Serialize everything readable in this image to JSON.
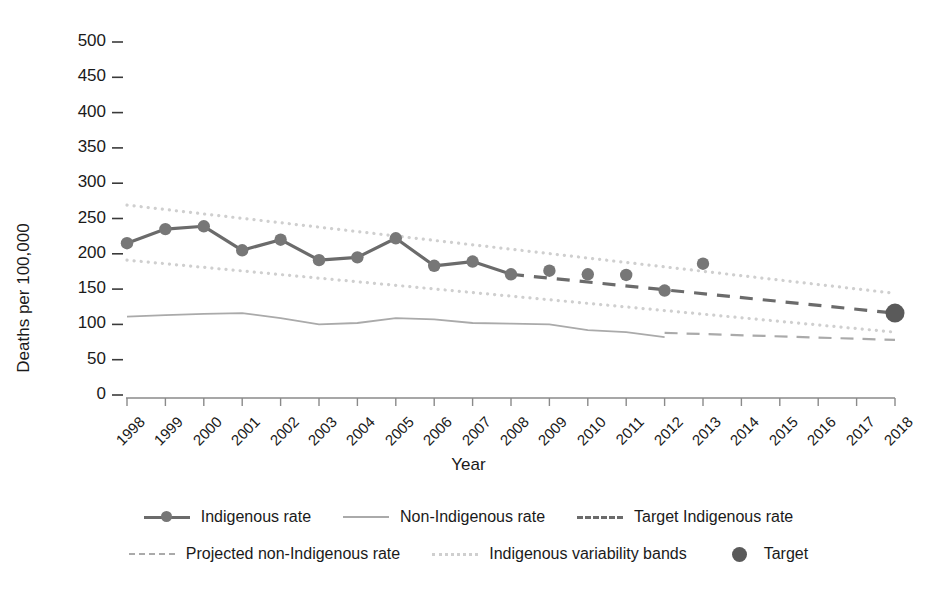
{
  "chart_data": {
    "type": "line",
    "title": "",
    "xlabel": "Year",
    "ylabel": "Deaths per 100,000",
    "xlim": [
      1998,
      2018
    ],
    "ylim": [
      0,
      500
    ],
    "ytick_labels": [
      "0",
      "50",
      "100",
      "150",
      "200",
      "250",
      "300",
      "350",
      "400",
      "450",
      "500"
    ],
    "ytick_values": [
      0,
      50,
      100,
      150,
      200,
      250,
      300,
      350,
      400,
      450,
      500
    ],
    "xtick_labels": [
      "1998",
      "1999",
      "2000",
      "2001",
      "2002",
      "2003",
      "2004",
      "2005",
      "2006",
      "2007",
      "2008",
      "2009",
      "2010",
      "2011",
      "2012",
      "2013",
      "2014",
      "2015",
      "2016",
      "2017",
      "2018"
    ],
    "grid": false,
    "legend_position": "bottom",
    "series": [
      {
        "name": "Indigenous rate",
        "style": "solid-with-markers",
        "color": "#6b6b6b",
        "x": [
          1998,
          1999,
          2000,
          2001,
          2002,
          2003,
          2004,
          2005,
          2006,
          2007,
          2008
        ],
        "values": [
          215,
          235,
          239,
          205,
          220,
          191,
          195,
          222,
          183,
          189,
          171
        ]
      },
      {
        "name": "Non-Indigenous rate",
        "style": "solid",
        "color": "#aaaaaa",
        "x": [
          1998,
          1999,
          2000,
          2001,
          2002,
          2003,
          2004,
          2005,
          2006,
          2007,
          2008,
          2009,
          2010,
          2011,
          2012
        ],
        "values": [
          111,
          113,
          115,
          116,
          109,
          100,
          102,
          109,
          107,
          102,
          101,
          100,
          92,
          89,
          82
        ]
      },
      {
        "name": "Target Indigenous rate",
        "style": "dashed",
        "color": "#6b6b6b",
        "x": [
          2008,
          2018
        ],
        "values": [
          171,
          116
        ]
      },
      {
        "name": "Projected non-Indigenous rate",
        "style": "dashed-light",
        "color": "#aaaaaa",
        "x": [
          2012,
          2018
        ],
        "values": [
          88,
          78
        ]
      },
      {
        "name": "Indigenous variability bands",
        "style": "dotted",
        "color": "#cfcfcf",
        "upper": {
          "x": [
            1998,
            2018
          ],
          "values": [
            269,
            144
          ]
        },
        "lower": {
          "x": [
            1998,
            2018
          ],
          "values": [
            191,
            89
          ]
        }
      },
      {
        "name": "Target",
        "style": "point",
        "color": "#5a5a5a",
        "x": [
          2018
        ],
        "values": [
          116
        ]
      }
    ],
    "scatter_points": {
      "name": "Indigenous rate annual points",
      "color": "#777777",
      "x": [
        2009,
        2010,
        2011,
        2012,
        2013
      ],
      "values": [
        176,
        171,
        170,
        148,
        186
      ]
    }
  },
  "axis": {
    "y_title": "Deaths per 100,000",
    "x_title": "Year"
  },
  "legend": {
    "rows": [
      [
        {
          "label": "Indigenous rate",
          "key": "line-marker-key"
        },
        {
          "label": "Non-Indigenous rate",
          "key": "line-solid-key"
        },
        {
          "label": "Target Indigenous rate",
          "key": "line-dashed-key"
        }
      ],
      [
        {
          "label": "Projected non-Indigenous rate",
          "key": "line-dashed-light-key"
        },
        {
          "label": "Indigenous variability bands",
          "key": "line-dotted-key"
        },
        {
          "label": "Target",
          "key": "point-key"
        }
      ]
    ]
  }
}
